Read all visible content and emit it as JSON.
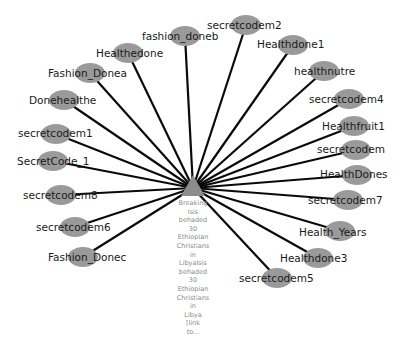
{
  "graph": {
    "hub": {
      "x": 193,
      "y": 188,
      "shape": "triangle",
      "color": "#8c8c8c",
      "label_lines": [
        "Breaking",
        "Isis",
        "behaded",
        "30",
        "Ethiopian",
        "Christians",
        "in",
        "LibyaIsis",
        "behaded",
        "30",
        "Ethiopian",
        "Christians",
        "in",
        "Libya",
        "[link",
        "to..."
      ]
    },
    "node_color": "#9a9a9a",
    "edge_color": "#0a0a0a",
    "nodes": [
      {
        "label": "fashion_doneb",
        "x": 185,
        "y": 36,
        "tx": 142,
        "ty": 40
      },
      {
        "label": "secretcodem2",
        "x": 246,
        "y": 25,
        "tx": 207,
        "ty": 29
      },
      {
        "label": "Healthdone1",
        "x": 293,
        "y": 45,
        "tx": 257,
        "ty": 48
      },
      {
        "label": "healthnutre",
        "x": 324,
        "y": 71,
        "tx": 294,
        "ty": 75
      },
      {
        "label": "secretcodem4",
        "x": 349,
        "y": 99,
        "tx": 309,
        "ty": 103
      },
      {
        "label": "Healthfruit1",
        "x": 354,
        "y": 126,
        "tx": 322,
        "ty": 130
      },
      {
        "label": "secretcodem",
        "x": 356,
        "y": 150,
        "tx": 317,
        "ty": 153
      },
      {
        "label": "HealthDones",
        "x": 357,
        "y": 175,
        "tx": 320,
        "ty": 178
      },
      {
        "label": "secretcodem7",
        "x": 348,
        "y": 200,
        "tx": 308,
        "ty": 204
      },
      {
        "label": "Health_Years",
        "x": 340,
        "y": 231,
        "tx": 299,
        "ty": 236
      },
      {
        "label": "Healthdone3",
        "x": 318,
        "y": 258,
        "tx": 280,
        "ty": 262
      },
      {
        "label": "secretcodem5",
        "x": 277,
        "y": 278,
        "tx": 239,
        "ty": 282
      },
      {
        "label": "Healthedone",
        "x": 128,
        "y": 53,
        "tx": 96,
        "ty": 57
      },
      {
        "label": "Fashion_Donea",
        "x": 90,
        "y": 73,
        "tx": 48,
        "ty": 77
      },
      {
        "label": "Donehealthe",
        "x": 64,
        "y": 100,
        "tx": 29,
        "ty": 104
      },
      {
        "label": "secretcodem1",
        "x": 56,
        "y": 134,
        "tx": 18,
        "ty": 137
      },
      {
        "label": "SecretCode_1",
        "x": 53,
        "y": 161,
        "tx": 17,
        "ty": 165
      },
      {
        "label": "secretcodem8",
        "x": 61,
        "y": 195,
        "tx": 23,
        "ty": 199
      },
      {
        "label": "secretcodem6",
        "x": 75,
        "y": 227,
        "tx": 36,
        "ty": 231
      },
      {
        "label": "Fashion_Donec",
        "x": 83,
        "y": 257,
        "tx": 48,
        "ty": 261
      }
    ]
  }
}
